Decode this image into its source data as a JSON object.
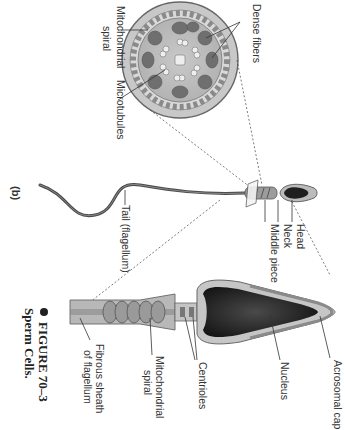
{
  "figure": {
    "panel_label": "(b)",
    "caption_number": "FIGURE 70–3",
    "caption_title": "Sperm Cells.",
    "orientation": "rotated 90° clockwise"
  },
  "cross_section_labels": {
    "mitochondrial_spiral": "Mitochondrial spiral",
    "mitochondrial_spiral_line1": "Mitochondrial",
    "mitochondrial_spiral_line2": "spiral",
    "microtubules": "Microtubules",
    "dense_fibers": "Dense fibers"
  },
  "whole_sperm_labels": {
    "head": "Head",
    "neck": "Neck",
    "middle_piece": "Middle piece",
    "tail": "Tail (flagellum)"
  },
  "detail_labels": {
    "acrosomal_cap": "Acrosomal cap",
    "nucleus": "Nucleus",
    "centrioles": "Centrioles",
    "mitochondrial_spiral_line1": "Mitochondrial",
    "mitochondrial_spiral_line2": "spiral",
    "fibrous_sheath_line1": "Fibrous sheath",
    "fibrous_sheath_line2": "of flagellum"
  },
  "colors": {
    "nucleus": "#1e1e1e",
    "cytoplasm": "#bdbdbd",
    "outline": "#555555",
    "dense_fiber": "#6e6e6e",
    "membrane": "#9a9a9a"
  }
}
